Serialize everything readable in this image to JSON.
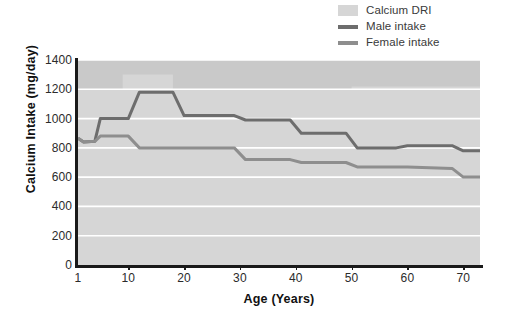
{
  "chart_data": {
    "type": "line",
    "title": "",
    "xlabel": "Age (Years)",
    "ylabel": "Calcium Intake (mg/day)",
    "xlim": [
      1,
      73
    ],
    "ylim": [
      0,
      1400
    ],
    "xticks": [
      1,
      10,
      20,
      30,
      40,
      50,
      60,
      70
    ],
    "xticklabels": [
      "1",
      "10",
      "20",
      "30",
      "40",
      "50",
      "60",
      "70"
    ],
    "yticks": [
      0,
      200,
      400,
      600,
      800,
      1000,
      1200,
      1400
    ],
    "yticklabels": [
      "0",
      "200",
      "400",
      "600",
      "800",
      "1000",
      "1200",
      "1400"
    ],
    "grid": "horizontal-white",
    "legend_position": "top-right",
    "plot_background": "#c9c9c9",
    "series": [
      {
        "name": "Calcium DRI",
        "type": "area",
        "color": "#d6d6d6",
        "x": [
          1,
          4,
          4,
          9,
          9,
          18,
          18,
          50,
          50,
          73
        ],
        "values": [
          1200,
          1200,
          1200,
          1200,
          1300,
          1300,
          1200,
          1200,
          1220,
          1220
        ]
      },
      {
        "name": "Male intake",
        "type": "step-line",
        "color": "#6d6d6d",
        "x": [
          1,
          2,
          4,
          5,
          10,
          12,
          18,
          20,
          29,
          31,
          39,
          41,
          49,
          51,
          58,
          60,
          68,
          70,
          73
        ],
        "values": [
          865,
          840,
          845,
          1000,
          1000,
          1180,
          1180,
          1020,
          1020,
          990,
          990,
          900,
          900,
          800,
          800,
          815,
          815,
          780,
          780
        ]
      },
      {
        "name": "Female intake",
        "type": "step-line",
        "color": "#8e8e8e",
        "x": [
          1,
          2,
          4,
          5,
          10,
          12,
          18,
          29,
          31,
          39,
          41,
          49,
          51,
          60,
          68,
          70,
          73
        ],
        "values": [
          865,
          840,
          845,
          880,
          880,
          800,
          800,
          800,
          720,
          720,
          700,
          700,
          670,
          670,
          660,
          600,
          600
        ]
      }
    ]
  },
  "legend": {
    "items": [
      {
        "label": "Calcium DRI",
        "marker": "box",
        "color": "#d6d6d6"
      },
      {
        "label": "Male intake",
        "marker": "line",
        "color": "#6d6d6d"
      },
      {
        "label": "Female intake",
        "marker": "line",
        "color": "#8e8e8e"
      }
    ]
  }
}
